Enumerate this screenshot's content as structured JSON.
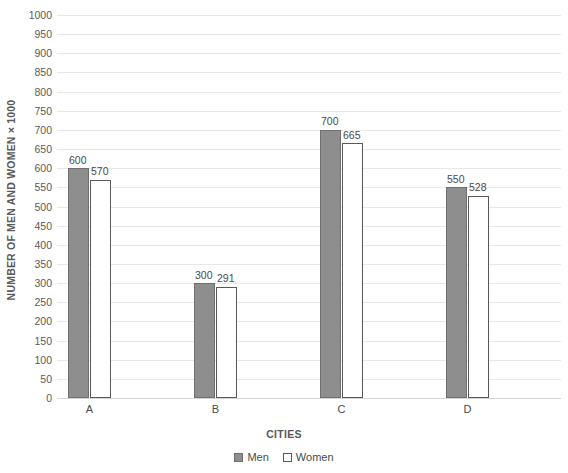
{
  "chart_data": {
    "type": "bar",
    "title": "",
    "subtitle": "",
    "xlabel": "CITIES",
    "ylabel": "NUMBER OF MEN AND WOMEN × 1000",
    "categories": [
      "A",
      "B",
      "C",
      "D"
    ],
    "series": [
      {
        "name": "Men",
        "values": [
          600,
          300,
          700,
          550
        ],
        "color": "#8e8e8e"
      },
      {
        "name": "Women",
        "values": [
          570,
          291,
          665,
          528
        ],
        "color": "#ffffff"
      }
    ],
    "ylim": [
      0,
      1000
    ],
    "ytick_step": 50,
    "yticks": [
      0,
      50,
      100,
      150,
      200,
      250,
      300,
      350,
      400,
      450,
      500,
      550,
      600,
      650,
      700,
      750,
      800,
      850,
      900,
      950,
      1000
    ],
    "ytick_labels": [
      "0",
      "50",
      "100",
      "150",
      "200",
      "250",
      "300",
      "350",
      "400",
      "450",
      "500",
      "550",
      "600",
      "650",
      "700",
      "750",
      "800",
      "850",
      "900",
      "950",
      "1000"
    ],
    "grid": true,
    "grid_axis": "y",
    "grid_color": "#e8e8e8",
    "legend_position": "bottom",
    "data_labels": true,
    "data_label_values": {
      "Men": [
        "600",
        "300",
        "700",
        "550"
      ],
      "Women": [
        "570",
        "291",
        "665",
        "528"
      ]
    }
  },
  "legend": {
    "items": [
      {
        "label": "Men",
        "style": "men"
      },
      {
        "label": "Women",
        "style": "women"
      }
    ]
  },
  "axes": {
    "y_title": "NUMBER OF MEN AND WOMEN × 1000",
    "x_title": "CITIES"
  }
}
